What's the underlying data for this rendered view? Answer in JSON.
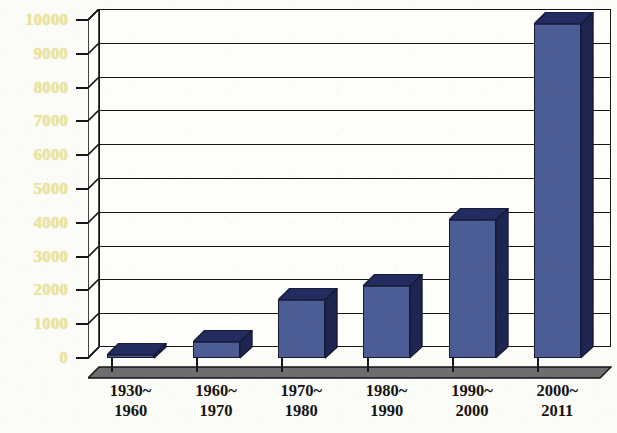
{
  "chart_data": {
    "type": "bar",
    "title": "",
    "subtitle": "",
    "xlabel": "",
    "ylabel": "",
    "categories": [
      "1930~1960",
      "1960~1970",
      "1970~1980",
      "1980~1990",
      "1990~2000",
      "2000~2011"
    ],
    "category_lines": [
      {
        "line1": "1930~",
        "line2": "1960"
      },
      {
        "line1": "1960~",
        "line2": "1970"
      },
      {
        "line1": "1970~",
        "line2": "1980"
      },
      {
        "line1": "1980~",
        "line2": "1990"
      },
      {
        "line1": "1990~",
        "line2": "2000"
      },
      {
        "line1": "2000~",
        "line2": "2011"
      }
    ],
    "values": [
      120,
      500,
      1750,
      2150,
      4100,
      9900
    ],
    "ylim": [
      0,
      10000
    ],
    "ytick_labels": [
      "10000",
      "9000",
      "8000",
      "7000",
      "6000",
      "5000",
      "4000",
      "3000",
      "2000",
      "1000",
      "0"
    ],
    "ytick_values": [
      10000,
      9000,
      8000,
      7000,
      6000,
      5000,
      4000,
      3000,
      2000,
      1000,
      0
    ],
    "grid": true,
    "grid_orientation": "horizontal",
    "legend": false,
    "legend_position": "none",
    "style_3d": true,
    "annotations": []
  },
  "style": {
    "bar_front_color": "#4c5c94",
    "bar_side_color": "#1d2550",
    "bar_top_color": "#232c5e",
    "bar_outline_color": "#161a33",
    "ytick_label_color": "#ece49a",
    "xtick_label_color": "#141414",
    "axis_color": "#15151a",
    "plot_background": "#fdfdfa",
    "page_background": "#fbfbf7",
    "floor_color": "#6e6e6e"
  }
}
